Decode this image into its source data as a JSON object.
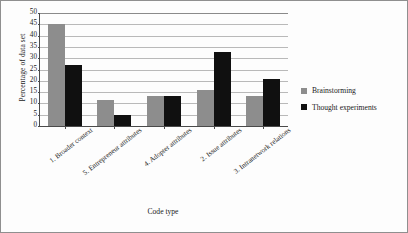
{
  "chart_data": {
    "type": "bar",
    "title": "",
    "xlabel": "Code type",
    "ylabel": "Percentage of data set",
    "ylim": [
      0,
      50
    ],
    "ytick_step": 5,
    "yticks": [
      0,
      5,
      10,
      15,
      20,
      25,
      30,
      35,
      40,
      45,
      50
    ],
    "grid": true,
    "legend_position": "right",
    "categories": [
      "1. Broader context",
      "5. Entrepreneur attributes",
      "4. Adopter attributes",
      "2. Issue attributes",
      "3. Intranetwork relations"
    ],
    "series": [
      {
        "name": "Brainstorming",
        "color": "#8d8d8d",
        "values": [
          45,
          11.5,
          13.2,
          16,
          13.3
        ]
      },
      {
        "name": "Thought experiments",
        "color": "#101010",
        "values": [
          27,
          5,
          13.4,
          32.8,
          21
        ]
      }
    ]
  },
  "legend": {
    "items": [
      {
        "label": "Brainstorming"
      },
      {
        "label": "Thought experiments"
      }
    ]
  }
}
